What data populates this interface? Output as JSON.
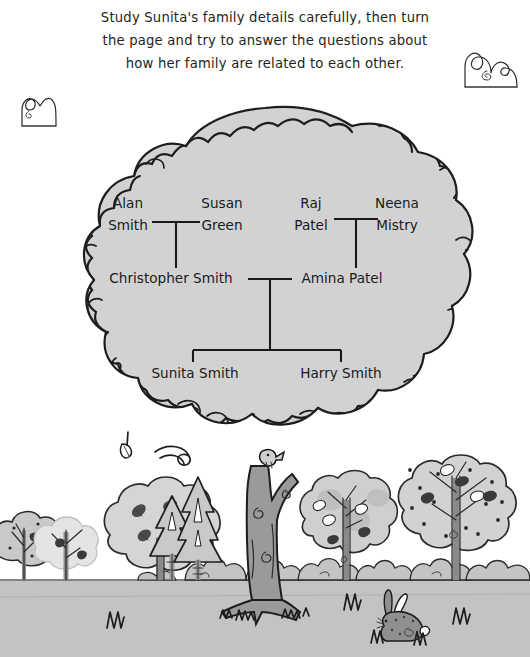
{
  "page": {
    "width": 530,
    "height": 657,
    "background_color": "#ffffff"
  },
  "instructions": {
    "name": "activity-instructions",
    "lines": [
      "Study Sunita's family details carefully, then turn",
      "the page and try to answer the questions about",
      "how her family are related to each other."
    ],
    "full_text": "Study Sunita's family details carefully, then turn the page and try to answer the questions about how her family are related to each other."
  },
  "family_tree": {
    "title": "Sunita's family tree",
    "generations": [
      {
        "level": 1,
        "label": "grandparents",
        "people": [
          {
            "id": "alan-smith",
            "first": "Alan",
            "last": "Smith",
            "x": 128,
            "y": 207
          },
          {
            "id": "susan-green",
            "first": "Susan",
            "last": "Green",
            "x": 222,
            "y": 207
          },
          {
            "id": "raj-patel",
            "first": "Raj",
            "last": "Patel",
            "x": 311,
            "y": 207
          },
          {
            "id": "neena-mistry",
            "first": "Neena",
            "last": "Mistry",
            "x": 397,
            "y": 207
          }
        ]
      },
      {
        "level": 2,
        "label": "parents",
        "people": [
          {
            "id": "christopher-smith",
            "full": "Christopher Smith",
            "x": 171,
            "y": 281
          },
          {
            "id": "amina-patel",
            "full": "Amina Patel",
            "x": 342,
            "y": 281
          }
        ]
      },
      {
        "level": 3,
        "label": "children",
        "people": [
          {
            "id": "sunita-smith",
            "full": "Sunita Smith",
            "x": 195,
            "y": 375
          },
          {
            "id": "harry-smith",
            "full": "Harry Smith",
            "x": 341,
            "y": 375
          }
        ]
      }
    ],
    "marriages": [
      {
        "id": "marriage-alan-susan",
        "partners": [
          "alan-smith",
          "susan-green"
        ],
        "child": "christopher-smith"
      },
      {
        "id": "marriage-raj-neena",
        "partners": [
          "raj-patel",
          "neena-mistry"
        ],
        "child": "amina-patel"
      },
      {
        "id": "marriage-christopher-amina",
        "partners": [
          "christopher-smith",
          "amina-patel"
        ],
        "children": [
          "sunita-smith",
          "harry-smith"
        ]
      }
    ]
  },
  "illustration": {
    "scene_name": "family-tree-woodland-scene",
    "main_tree": {
      "name": "main-family-tree",
      "canopy_fill": "#d2d2d2",
      "trunk_fill": "#9a9a9a",
      "outline_color": "#1d1d1d"
    },
    "ground": {
      "name": "ground-strip",
      "fill": "#c3c3c3",
      "line_color": "#7a7a7a"
    },
    "sky": {
      "name": "sky-background",
      "fill": "#ffffff"
    },
    "doodles": [
      {
        "id": "bush-doodle-top-left",
        "name": "bush-doodle-icon",
        "x": 20,
        "y": 92
      },
      {
        "id": "bush-doodle-top-right",
        "name": "bush-doodle-icon",
        "x": 463,
        "y": 45
      }
    ],
    "background_trees": [
      {
        "id": "bg-tree-1",
        "name": "spotted-tree-icon",
        "x": 18,
        "kind": "spotted"
      },
      {
        "id": "bg-tree-2",
        "name": "bare-tree-icon",
        "x": 52,
        "kind": "bare"
      },
      {
        "id": "bg-tree-3",
        "name": "leafy-tree-icon",
        "x": 105,
        "kind": "leafy"
      },
      {
        "id": "bg-tree-4",
        "name": "pine-tree-icon",
        "x": 172,
        "kind": "pine"
      },
      {
        "id": "bg-tree-5",
        "name": "pine-tree-icon",
        "x": 196,
        "kind": "pine-tall"
      },
      {
        "id": "bg-tree-6",
        "name": "leafy-tree-icon",
        "x": 343,
        "kind": "leafy"
      },
      {
        "id": "bg-tree-7",
        "name": "spotted-tree-icon",
        "x": 448,
        "kind": "spotted"
      }
    ],
    "animals": [
      {
        "id": "bird-on-branch",
        "name": "bird-icon",
        "x": 268,
        "y": 468
      },
      {
        "id": "rabbit",
        "name": "rabbit-icon",
        "x": 392,
        "y": 620
      }
    ],
    "grass_tufts": [
      {
        "id": "grass-tuft-1",
        "name": "grass-tuft-icon",
        "x": 113,
        "y": 622
      },
      {
        "id": "grass-tuft-2",
        "name": "grass-tuft-icon",
        "x": 349,
        "y": 603
      },
      {
        "id": "grass-tuft-3",
        "name": "grass-tuft-icon",
        "x": 459,
        "y": 617
      }
    ]
  },
  "colors": {
    "ink": "#1d1d1d",
    "canopy": "#d2d2d2",
    "trunk": "#9a9a9a",
    "ground": "#c3c3c3",
    "bush": "#c8c8c8",
    "text": "#1a1a1a",
    "page": "#ffffff"
  }
}
